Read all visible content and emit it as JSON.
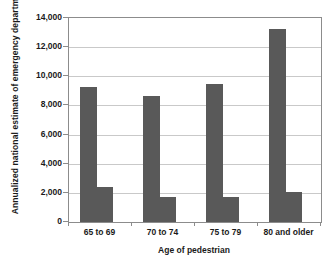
{
  "chart_data": {
    "type": "bar",
    "title": "",
    "xlabel": "Age of pedestrian",
    "ylabel": "Annualized national estimate of emergency department injuries",
    "categories": [
      "65 to 69",
      "70 to 74",
      "75 to 79",
      "80 and older"
    ],
    "series": [
      {
        "name": "primary",
        "values": [
          9250,
          8650,
          9500,
          13250
        ]
      },
      {
        "name": "secondary",
        "values": [
          2400,
          1750,
          1700,
          2050
        ]
      }
    ],
    "ylim": [
      0,
      14000
    ],
    "ytick_values": [
      0,
      2000,
      4000,
      6000,
      8000,
      10000,
      12000,
      14000
    ],
    "ytick_labels": [
      "0",
      "2,000",
      "4,000",
      "6,000",
      "8,000",
      "10,000",
      "12,000",
      "14,000"
    ],
    "grid": true,
    "legend": false,
    "bar_color": "#595959",
    "gridline_color": "#c9c9c9",
    "axis_color": "#8c8c8c",
    "plot_background": "#ffffff"
  }
}
